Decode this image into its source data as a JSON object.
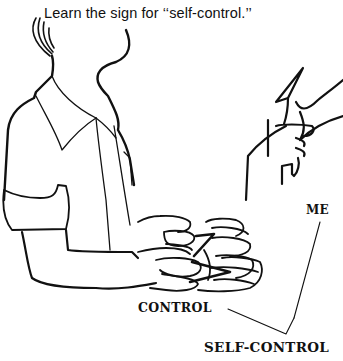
{
  "instruction": "Learn the sign for ‘‘self-control.’’",
  "illustration": {
    "subject": "person signing self-control",
    "labels": {
      "me": "ME",
      "control": "CONTROL",
      "self_control": "SELF-CONTROL"
    }
  },
  "colors": {
    "ink": "#111111",
    "background": "#ffffff"
  }
}
